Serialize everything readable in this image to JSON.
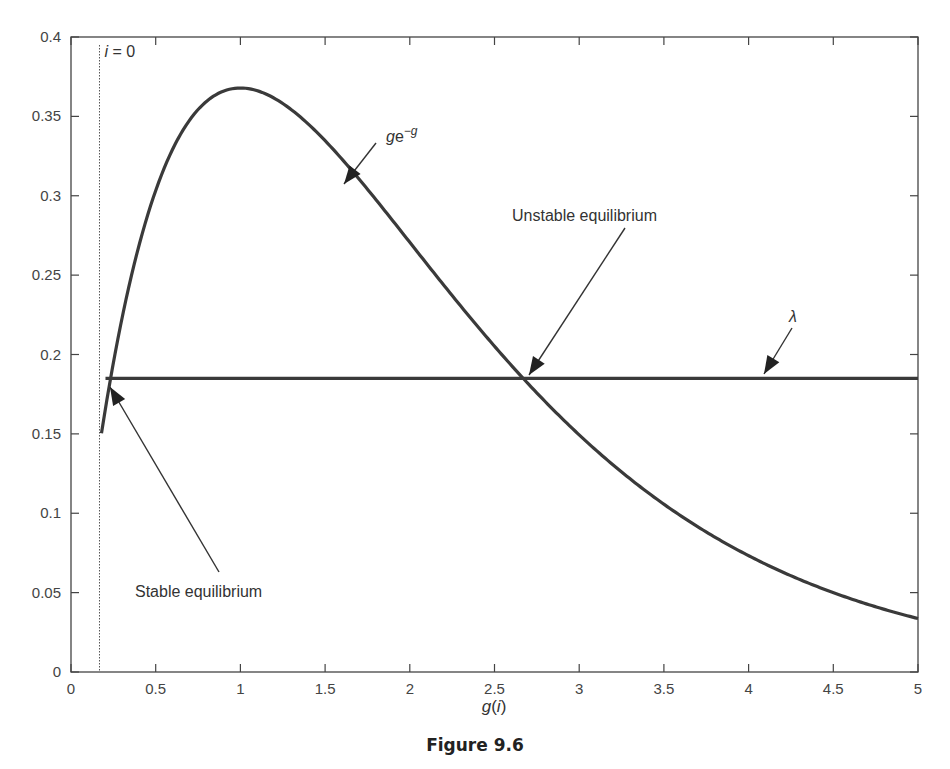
{
  "chart_data": {
    "type": "line",
    "title": "",
    "caption": "Figure 9.6",
    "xlabel": "g(i)",
    "ylabel": "",
    "xlim": [
      0,
      5
    ],
    "ylim": [
      0,
      0.4
    ],
    "grid": false,
    "x_ticks": [
      "0",
      "0.5",
      "1",
      "1.5",
      "2",
      "2.5",
      "3",
      "3.5",
      "4",
      "4.5",
      "5"
    ],
    "y_ticks": [
      "0",
      "0.05",
      "0.1",
      "0.15",
      "0.2",
      "0.25",
      "0.3",
      "0.35",
      "0.4"
    ],
    "series": [
      {
        "name": "ge^-g",
        "function": "g*exp(-g)",
        "x_range": [
          0.18,
          5
        ],
        "x": [
          0.18,
          0.25,
          0.5,
          0.75,
          1.0,
          1.25,
          1.5,
          1.75,
          2.0,
          2.25,
          2.5,
          2.75,
          3.0,
          3.5,
          4.0,
          4.5,
          5.0
        ],
        "values": [
          0.15,
          0.195,
          0.303,
          0.354,
          0.368,
          0.358,
          0.335,
          0.304,
          0.271,
          0.237,
          0.205,
          0.175,
          0.149,
          0.106,
          0.073,
          0.05,
          0.034
        ]
      },
      {
        "name": "λ",
        "constant": 0.185,
        "x_range": [
          0.18,
          5
        ],
        "x": [
          0.18,
          5
        ],
        "values": [
          0.185,
          0.185
        ]
      }
    ],
    "vertical_line": {
      "label_italic": "i",
      "label_rest": " = 0",
      "x": 0.18,
      "style": "dotted"
    },
    "annotations": [
      {
        "text": "ge",
        "superscript": "−g",
        "arrow_to": [
          1.6,
          0.325
        ],
        "text_pos": [
          1.88,
          0.38
        ]
      },
      {
        "text": "Unstable equilibrium",
        "arrow_to": [
          2.68,
          0.185
        ],
        "text_pos": [
          3.0,
          0.29
        ]
      },
      {
        "text": "λ",
        "arrow_to": [
          4.1,
          0.187
        ],
        "text_pos": [
          4.25,
          0.215
        ]
      },
      {
        "text": "Stable equilibrium",
        "arrow_to": [
          0.24,
          0.18
        ],
        "text_pos": [
          0.85,
          0.05
        ]
      }
    ]
  }
}
